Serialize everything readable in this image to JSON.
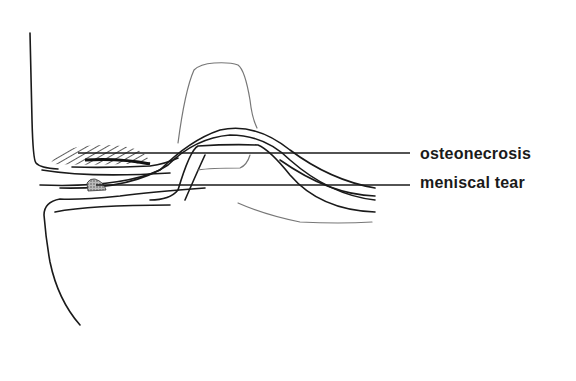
{
  "diagram": {
    "type": "anatomical line drawing (knee joint, sagittal view)",
    "labels": [
      {
        "id": "osteonecrosis",
        "text": "osteonecrosis"
      },
      {
        "id": "meniscal_tear",
        "text": "meniscal tear"
      }
    ],
    "colors": {
      "line": "#1a1a1a",
      "faint_line": "#777777",
      "background": "#ffffff",
      "hatch": "#333333",
      "stipple": "#999999"
    }
  }
}
